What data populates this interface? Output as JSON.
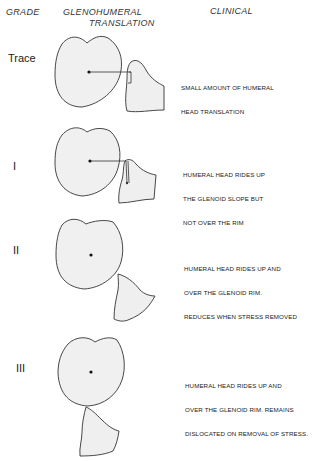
{
  "headers": {
    "grade": "GRADE",
    "translation_line1": "GLENOHUMERAL",
    "translation_line2": "TRANSLATION",
    "clinical": "CLINICAL"
  },
  "rows": [
    {
      "grade": "Trace",
      "clinical": [
        "SMALL AMOUNT OF HUMERAL",
        "HEAD TRANSLATION"
      ]
    },
    {
      "grade": "I",
      "clinical": [
        "HUMERAL HEAD RIDES UP",
        "THE GLENOID SLOPE BUT",
        "NOT OVER THE RIM"
      ]
    },
    {
      "grade": "II",
      "clinical": [
        "HUMERAL HEAD RIDES UP AND",
        "OVER THE GLENOID RIM.",
        "REDUCES WHEN STRESS REMOVED"
      ]
    },
    {
      "grade": "III",
      "clinical": [
        "HUMERAL HEAD RIDES UP AND",
        "OVER THE GLENOID RIM. REMAINS",
        "DISLOCATED ON REMOVAL OF STRESS."
      ]
    }
  ],
  "colors": {
    "stroke": "#333333",
    "fill": "#eeeeee"
  }
}
